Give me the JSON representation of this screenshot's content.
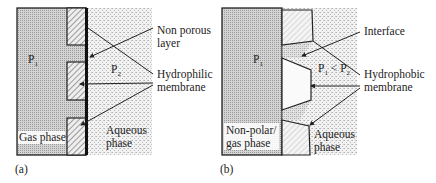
{
  "figure": {
    "panel_a": {
      "tag": "(a)",
      "left_region": {
        "pressure": "P",
        "pressure_sub": "1",
        "label": "Gas phase"
      },
      "right_region": {
        "pressure": "P",
        "pressure_sub": "2",
        "label_line1": "Aqueous",
        "label_line2": "phase"
      },
      "callouts": {
        "non_porous": {
          "line1": "Non porous",
          "line2": "layer"
        },
        "membrane": {
          "line1": "Hydrophilic",
          "line2": "membrane"
        }
      }
    },
    "panel_b": {
      "tag": "(b)",
      "left_region": {
        "pressure": "P",
        "pressure_sub": "1",
        "label_line1": "Non-polar/",
        "label_line2": "gas phase"
      },
      "relation": {
        "p1": "P",
        "p1_sub": "1",
        "op": " < ",
        "p2": "P",
        "p2_sub": "2"
      },
      "right_region": {
        "label_line1": "Aqueous",
        "label_line2": "phase"
      },
      "callouts": {
        "interface": {
          "line1": "Interface"
        },
        "membrane": {
          "line1": "Hydrophobic",
          "line2": "membrane"
        }
      }
    }
  },
  "colors": {
    "gas_fill": "#c8c8c8",
    "aqueous_fill": "#e4e4e4",
    "outline": "#222222",
    "hatch": "#555555"
  }
}
